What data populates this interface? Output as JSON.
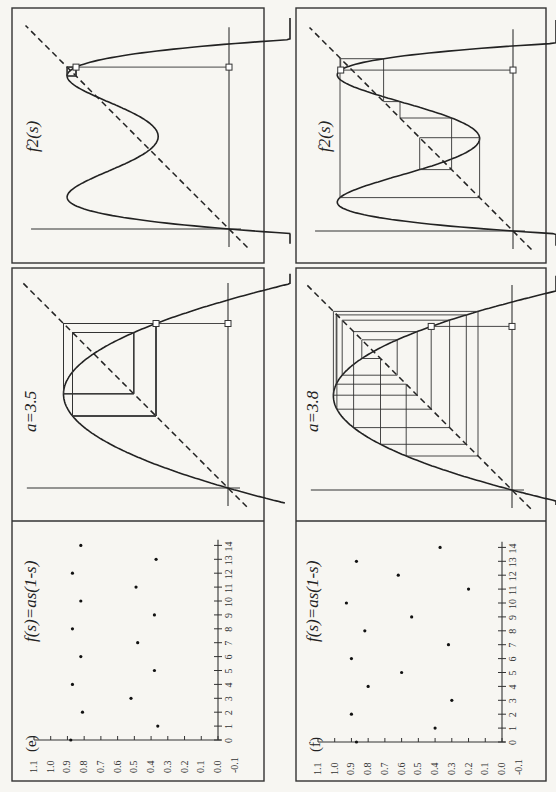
{
  "figure": {
    "orientation": "rotated-90-ccw",
    "panels": [
      {
        "id": "e",
        "panel_label": "(e)",
        "a": 3.5,
        "a_label": "a=3.5",
        "map_label": "f(s)=as(1-s)",
        "f2_label": "f2(s)",
        "s0": 0.875
      },
      {
        "id": "f",
        "panel_label": "(f)",
        "a": 3.8,
        "a_label": "a=3.8",
        "map_label": "f(s)=as(1-s)",
        "f2_label": "f2(s)",
        "s0": 0.87
      }
    ]
  },
  "chart_data": [
    {
      "type": "scatter",
      "panel": "(e)",
      "title": "f(s)=as(1-s)",
      "xlabel": "iteration",
      "ylabel": "s",
      "x": [
        0,
        1,
        2,
        3,
        4,
        5,
        6,
        7,
        8,
        9,
        10,
        11,
        12,
        13,
        14
      ],
      "y": [
        0.88,
        0.36,
        0.81,
        0.52,
        0.87,
        0.38,
        0.82,
        0.48,
        0.87,
        0.38,
        0.82,
        0.49,
        0.87,
        0.37,
        0.82
      ],
      "xlim": [
        0,
        14
      ],
      "ylim": [
        -0.1,
        1.1
      ],
      "x_ticks": [
        "0",
        "1",
        "2",
        "3",
        "4",
        "5",
        "6",
        "7",
        "8",
        "9",
        "10",
        "11",
        "12",
        "13",
        "14"
      ],
      "y_ticks": [
        "1.1",
        "1.0",
        "0.9",
        "0.8",
        "0.7",
        "0.6",
        "0.5",
        "0.4",
        "0.3",
        "0.2",
        "0.1",
        "0.0",
        "-0.1"
      ]
    },
    {
      "type": "scatter",
      "panel": "(f)",
      "title": "f(s)=as(1-s)",
      "xlabel": "iteration",
      "ylabel": "s",
      "x": [
        0,
        1,
        2,
        3,
        4,
        5,
        6,
        7,
        8,
        9,
        10,
        11,
        12,
        13,
        14
      ],
      "y": [
        0.87,
        0.4,
        0.9,
        0.3,
        0.8,
        0.6,
        0.9,
        0.32,
        0.82,
        0.54,
        0.93,
        0.2,
        0.62,
        0.87,
        0.37
      ],
      "xlim": [
        0,
        14
      ],
      "ylim": [
        -0.1,
        1.1
      ],
      "x_ticks": [
        "0",
        "1",
        "2",
        "3",
        "4",
        "5",
        "6",
        "7",
        "8",
        "9",
        "10",
        "11",
        "12",
        "13",
        "14"
      ],
      "y_ticks": [
        "1.1",
        "1.0",
        "0.9",
        "0.8",
        "0.7",
        "0.6",
        "0.5",
        "0.4",
        "0.3",
        "0.2",
        "0.1",
        "0.0",
        "-0.1"
      ]
    },
    {
      "type": "line",
      "panel": "(e) cobweb",
      "title": "a=3.5",
      "series": [
        {
          "name": "f(s)=as(1-s)",
          "function": "a*s*(1-s)",
          "a": 3.5
        },
        {
          "name": "identity",
          "function": "s",
          "style": "dashed"
        }
      ],
      "cobweb_start": 0.875,
      "cobweb_iterations": 14,
      "xlim": [
        0,
        1.05
      ],
      "ylim": [
        0,
        1
      ]
    },
    {
      "type": "line",
      "panel": "(f) cobweb",
      "title": "a=3.8",
      "series": [
        {
          "name": "f(s)=as(1-s)",
          "function": "a*s*(1-s)",
          "a": 3.8
        },
        {
          "name": "identity",
          "function": "s",
          "style": "dashed"
        }
      ],
      "cobweb_start": 0.87,
      "cobweb_iterations": 14,
      "xlim": [
        0,
        1.05
      ],
      "ylim": [
        0,
        1
      ]
    },
    {
      "type": "line",
      "panel": "(e) second iterate",
      "title": "f2(s)",
      "series": [
        {
          "name": "f2(s)",
          "function": "f(f(s))",
          "a": 3.5
        },
        {
          "name": "identity",
          "function": "s",
          "style": "dashed"
        }
      ],
      "cobweb_start": 0.875,
      "cobweb_iterations": 7,
      "xlim": [
        0,
        1.05
      ],
      "ylim": [
        0,
        1
      ]
    },
    {
      "type": "line",
      "panel": "(f) second iterate",
      "title": "f2(s)",
      "series": [
        {
          "name": "f2(s)",
          "function": "f(f(s))",
          "a": 3.8
        },
        {
          "name": "identity",
          "function": "s",
          "style": "dashed"
        }
      ],
      "cobweb_start": 0.87,
      "cobweb_iterations": 7,
      "xlim": [
        0,
        1.05
      ],
      "ylim": [
        0,
        1
      ]
    }
  ]
}
